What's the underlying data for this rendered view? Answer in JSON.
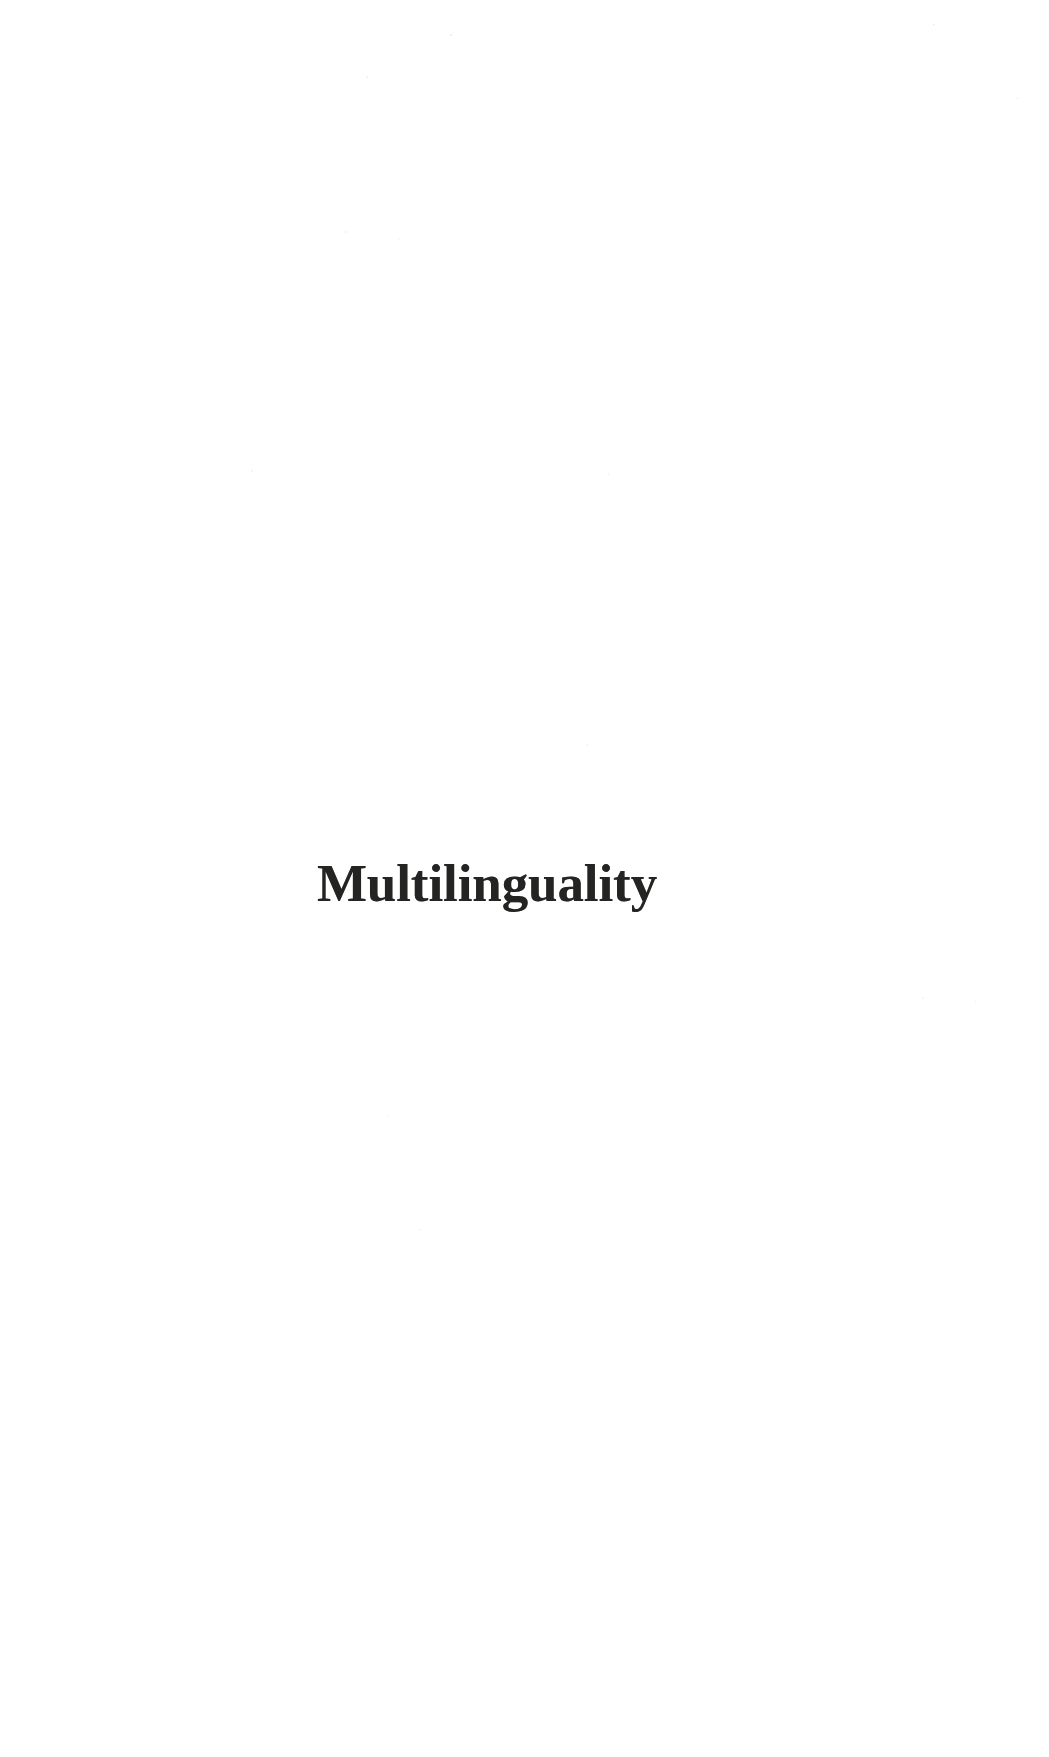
{
  "document": {
    "page_type": "part-title-page",
    "background_color": "#ffffff",
    "text_color": "#242422"
  },
  "part_title": {
    "text": "Multilinguality"
  }
}
